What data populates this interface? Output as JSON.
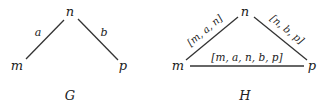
{
  "graphs": [
    {
      "name": "G",
      "nodes": {
        "top": "n",
        "left": "m",
        "right": "p"
      },
      "edges": [
        {
          "from": "m",
          "to": "n",
          "label": "a"
        },
        {
          "from": "n",
          "to": "p",
          "label": "b"
        }
      ]
    },
    {
      "name": "H",
      "nodes": {
        "top": "n",
        "left": "m",
        "right": "p"
      },
      "edges": [
        {
          "from": "m",
          "to": "n",
          "label": "[m, a, n]"
        },
        {
          "from": "n",
          "to": "p",
          "label": "[n, b, p]"
        },
        {
          "from": "m",
          "to": "p",
          "label": "[m, a, n, b, p]"
        }
      ]
    }
  ],
  "colors": {
    "line": "#333333",
    "text": "#222222"
  }
}
